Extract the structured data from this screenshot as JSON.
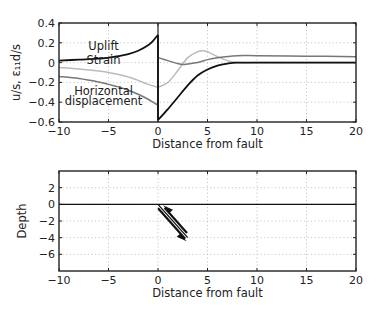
{
  "chart_data": [
    {
      "type": "line",
      "title": "",
      "xlabel": "Distance from fault",
      "ylabel": "u/s, ε₁₁d/s",
      "xlim": [
        -10,
        20
      ],
      "ylim": [
        -0.6,
        0.4
      ],
      "xticks": [
        -10,
        -5,
        0,
        5,
        10,
        15,
        20
      ],
      "yticks": [
        -0.6,
        -0.4,
        -0.2,
        0,
        0.2,
        0.4
      ],
      "ytick_labels": [
        "−0.6",
        "−0.4",
        "−0.2",
        "0",
        "0.2",
        "0.4"
      ],
      "xtick_labels": [
        "−10",
        "−5",
        "0",
        "5",
        "10",
        "15",
        "20"
      ],
      "grid": true,
      "discontinuity_at_x": 0,
      "annotations": [
        {
          "text": "Uplift",
          "x": -5.5,
          "y": 0.17
        },
        {
          "text": "Strain",
          "x": -5.5,
          "y": 0.03
        },
        {
          "text": "Horizontal",
          "x": -5.5,
          "y": -0.29
        },
        {
          "text": "displacement",
          "x": -5.5,
          "y": -0.39
        }
      ],
      "series": [
        {
          "name": "Uplift",
          "color": "#111111",
          "x": [
            -10,
            -8,
            -6,
            -5,
            -4,
            -3,
            -2,
            -1,
            -0.5,
            0,
            0.01,
            1,
            2,
            3,
            4,
            5,
            6,
            7,
            8,
            10,
            15,
            20
          ],
          "y": [
            0.02,
            0.03,
            0.04,
            0.05,
            0.065,
            0.085,
            0.12,
            0.175,
            0.22,
            0.28,
            -0.58,
            -0.47,
            -0.35,
            -0.23,
            -0.13,
            -0.07,
            -0.03,
            -0.01,
            0.0,
            0.0,
            0.0,
            0.0
          ]
        },
        {
          "name": "Strain",
          "color": "#bbbbbb",
          "x": [
            -10,
            -8,
            -6,
            -5,
            -4,
            -3,
            -2,
            -1,
            0,
            1,
            2,
            3,
            4,
            4.5,
            5,
            6,
            7,
            8,
            10,
            15,
            20
          ],
          "y": [
            -0.05,
            -0.065,
            -0.085,
            -0.1,
            -0.12,
            -0.145,
            -0.18,
            -0.22,
            -0.25,
            -0.2,
            -0.08,
            0.05,
            0.11,
            0.12,
            0.11,
            0.06,
            0.02,
            0.0,
            0.0,
            0.0,
            0.0
          ]
        },
        {
          "name": "Horizontal displacement",
          "color": "#777777",
          "x": [
            -10,
            -8,
            -6,
            -5,
            -4,
            -3,
            -2,
            -1,
            -0.5,
            0,
            0.01,
            1,
            2,
            2.5,
            3,
            4,
            5,
            6,
            8,
            10,
            15,
            20
          ],
          "y": [
            -0.14,
            -0.16,
            -0.195,
            -0.22,
            -0.245,
            -0.28,
            -0.32,
            -0.37,
            -0.4,
            -0.43,
            0.05,
            0.02,
            -0.01,
            -0.02,
            -0.015,
            0.0,
            0.03,
            0.05,
            0.07,
            0.07,
            0.065,
            0.06
          ]
        }
      ]
    },
    {
      "type": "line",
      "title": "",
      "xlabel": "Distance from fault",
      "ylabel": "Depth",
      "xlim": [
        -10,
        20
      ],
      "ylim": [
        -8,
        4
      ],
      "xticks": [
        -10,
        -5,
        0,
        5,
        10,
        15,
        20
      ],
      "xtick_labels": [
        "−10",
        "−5",
        "0",
        "5",
        "10",
        "15",
        "20"
      ],
      "yticks": [
        -6,
        -4,
        -2,
        0,
        2
      ],
      "ytick_labels": [
        "−6",
        "−4",
        "−2",
        "0",
        "2"
      ],
      "grid": true,
      "series": [
        {
          "name": "Surface",
          "color": "#111111",
          "x": [
            -10,
            20
          ],
          "y": [
            0,
            0
          ]
        }
      ],
      "fault": {
        "description": "Dipping fault shown as double line with opposing slip arrows",
        "top": [
          0,
          0
        ],
        "bottom": [
          3,
          -4
        ],
        "slip_arrows": [
          "up-left (hanging side)",
          "down-right (foot side)"
        ],
        "color": "#111111"
      }
    }
  ]
}
